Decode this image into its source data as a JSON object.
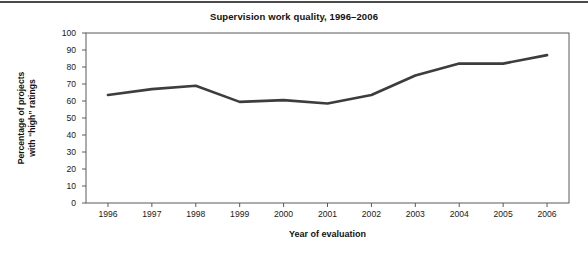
{
  "figure": {
    "top_rule_color": "#4a4a4a",
    "background": "#ffffff"
  },
  "chart_data": {
    "type": "line",
    "title": "Supervision work quality, 1996–2006",
    "xlabel": "Year of evaluation",
    "ylabel_line1": "Percentage of projects",
    "ylabel_line2": "with “high” ratings",
    "categories": [
      "1996",
      "1997",
      "1998",
      "1999",
      "2000",
      "2001",
      "2002",
      "2003",
      "2004",
      "2005",
      "2006"
    ],
    "values": [
      63.5,
      67,
      69,
      59.5,
      60.5,
      58.5,
      63.5,
      75,
      82,
      82,
      87
    ],
    "ylim": [
      0,
      100
    ],
    "yticks": [
      "100",
      "90",
      "80",
      "70",
      "60",
      "50",
      "40",
      "30",
      "20",
      "10",
      "0"
    ],
    "ytick_values": [
      100,
      90,
      80,
      70,
      60,
      50,
      40,
      30,
      20,
      10,
      0
    ],
    "grid": false,
    "legend": "none",
    "line_color": "#3d3d3d",
    "line_width": 2.6,
    "axis_color": "#5a5a5a"
  }
}
